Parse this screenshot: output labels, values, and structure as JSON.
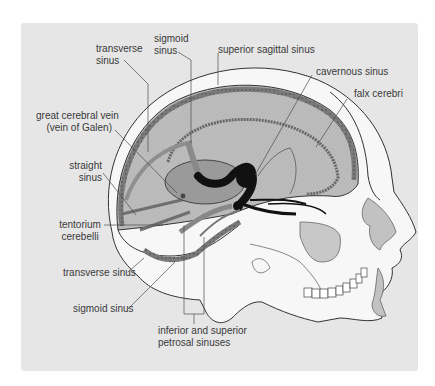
{
  "diagram": {
    "colors": {
      "panel_bg": "#e6e6e6",
      "bone": "#f7f7f7",
      "dura_fill": "#b9b9b9",
      "sinus_dark": "#6f6f6f",
      "vein_black": "#111111",
      "leader_line": "#4a4a4a",
      "label_text": "#3a3a3a"
    },
    "labels": {
      "transverse_sinus_top_1": "transverse",
      "transverse_sinus_top_2": "sinus",
      "sigmoid_sinus_top_1": "sigmoid",
      "sigmoid_sinus_top_2": "sinus",
      "superior_sagittal_sinus": "superior sagittal sinus",
      "cavernous_sinus": "cavernous sinus",
      "falx_cerebri": "falx cerebri",
      "great_cerebral_vein_1": "great cerebral vein",
      "great_cerebral_vein_2": "(vein of Galen)",
      "straight_sinus_1": "straight",
      "straight_sinus_2": "sinus",
      "tentorium_cerebelli_1": "tentorium",
      "tentorium_cerebelli_2": "cerebelli",
      "transverse_sinus_bottom": "transverse sinus",
      "sigmoid_sinus_bottom": "sigmoid sinus",
      "petrosal_sinuses_1": "inferior and superior",
      "petrosal_sinuses_2": "petrosal sinuses"
    }
  }
}
